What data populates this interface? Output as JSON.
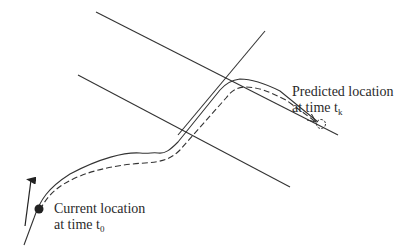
{
  "diagram": {
    "labels": {
      "current": {
        "line1": "Current location",
        "line2_prefix": "at time t",
        "line2_sub": "0"
      },
      "predicted": {
        "line1": "Predicted location",
        "line2_prefix": "at time t",
        "line2_sub": "k"
      }
    },
    "colors": {
      "stroke": "#333333",
      "background": "#ffffff"
    },
    "elements": [
      "road-boundary-upper",
      "road-boundary-lower",
      "crossing-road",
      "actual-path-solid",
      "predicted-path-dashed",
      "current-location-marker",
      "predicted-location-marker",
      "heading-arrow"
    ]
  }
}
